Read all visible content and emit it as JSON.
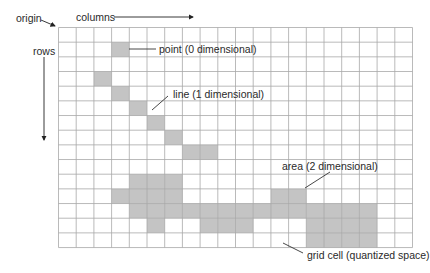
{
  "labels": {
    "origin": "origin",
    "columns": "columns",
    "rows": "rows",
    "point": "point (0 dimensional)",
    "line": "line (1 dimensional)",
    "area": "area (2 dimensional)",
    "grid_cell": "grid cell (quantized space)"
  },
  "grid": {
    "columns": 20,
    "rows": 15,
    "cell_width": 17.7,
    "cell_height": 14.67,
    "line_color": "#a8a8a8",
    "fill_color": "#c4c4c4",
    "shaded_cells": {
      "point": [
        [
          1,
          3
        ]
      ],
      "line": [
        [
          3,
          2
        ],
        [
          4,
          3
        ],
        [
          5,
          4
        ],
        [
          6,
          5
        ],
        [
          7,
          6
        ],
        [
          8,
          7
        ],
        [
          8,
          8
        ]
      ],
      "area": [
        [
          10,
          4
        ],
        [
          10,
          5
        ],
        [
          10,
          6
        ],
        [
          11,
          3
        ],
        [
          11,
          4
        ],
        [
          11,
          5
        ],
        [
          11,
          6
        ],
        [
          11,
          12
        ],
        [
          11,
          13
        ],
        [
          12,
          4
        ],
        [
          12,
          5
        ],
        [
          12,
          6
        ],
        [
          12,
          7
        ],
        [
          12,
          8
        ],
        [
          12,
          9
        ],
        [
          12,
          10
        ],
        [
          12,
          11
        ],
        [
          12,
          12
        ],
        [
          12,
          13
        ],
        [
          12,
          14
        ],
        [
          12,
          15
        ],
        [
          12,
          16
        ],
        [
          12,
          17
        ],
        [
          13,
          5
        ],
        [
          13,
          8
        ],
        [
          13,
          9
        ],
        [
          13,
          10
        ],
        [
          13,
          14
        ],
        [
          13,
          15
        ],
        [
          13,
          16
        ],
        [
          13,
          17
        ],
        [
          14,
          14
        ],
        [
          14,
          15
        ],
        [
          14,
          16
        ],
        [
          14,
          17
        ]
      ]
    }
  }
}
